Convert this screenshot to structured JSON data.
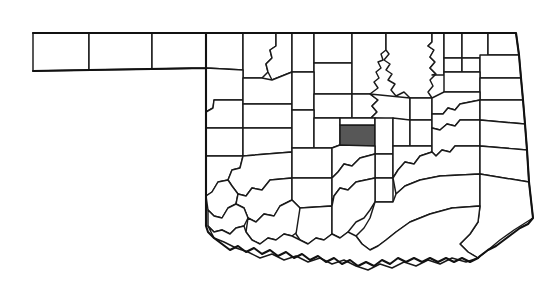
{
  "figure": {
    "kind": "choropleth-locator-map",
    "subject": "Oklahoma",
    "description": "Outline map of the state of Oklahoma divided into counties, with a single county filled solid dark gray in the central part of the state.",
    "background_color": "#ffffff",
    "county_fill_color": "#ffffff",
    "county_border_color": "#1a1a1a",
    "state_border_color": "#111111",
    "highlight_fill_color": "#575757",
    "highlighted_county_count": "1",
    "total_counties": "77",
    "panhandle_county_count": "3",
    "title": "",
    "subtitle": "",
    "legend": "",
    "labels_visible": "none",
    "scale_bar": "none",
    "north_arrow": "none"
  },
  "highlight": {
    "name": "highlighted-county",
    "position_description": "central Oklahoma",
    "approx_x": "340",
    "approx_y": "125",
    "approx_width": "35",
    "approx_height": "21"
  },
  "regions": {
    "panhandle": "three rectangular counties extending west along the top-left",
    "north_border": "straight horizontal line across the top",
    "east_border": "near-vertical line slanting slightly, with a notched river segment",
    "south_border": "irregular meandering river boundary (Red River)",
    "west_border": "straight vertical line at the panhandle tip"
  }
}
